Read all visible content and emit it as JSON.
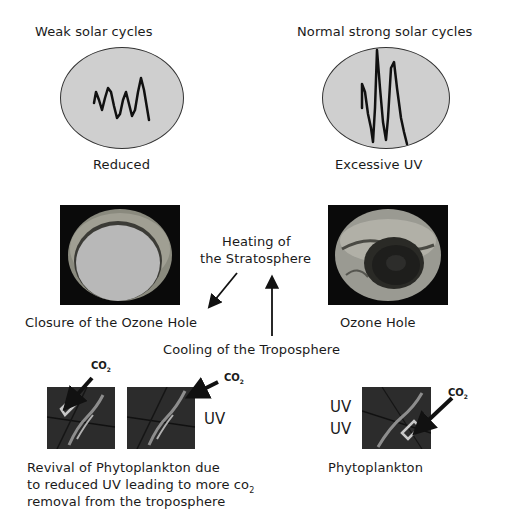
{
  "top": {
    "left": {
      "title": "Weak solar cycles",
      "caption": "Reduced",
      "icon": "weak-solar-cycle-waveform"
    },
    "right": {
      "title": "Normal strong solar cycles",
      "caption": "Excessive UV",
      "icon": "strong-solar-cycle-waveform"
    }
  },
  "middle": {
    "left_caption": "Closure of the Ozone Hole",
    "right_caption": "Ozone Hole",
    "center_label_line1": "Heating of",
    "center_label_line2": "the Stratosphere",
    "bottom_label": "Cooling of the Troposphere"
  },
  "bottom": {
    "co2_label": "CO",
    "co2_sub": "2",
    "uv_label": "UV",
    "left_caption_line1": "Revival of Phytoplankton  due",
    "left_caption_line2_pre": "to reduced UV leading to more co",
    "left_caption_line2_sub": "2",
    "left_caption_line3": "removal from the troposphere",
    "right_caption": "Phytoplankton"
  },
  "colors": {
    "oval_fill": "#cfcfcf",
    "ozone_bg": "#0a0a0a",
    "ozone_closed_fill": "#b8b8b8",
    "phyto_bg": "#2c2c2c",
    "text": "#1a1a1a"
  }
}
